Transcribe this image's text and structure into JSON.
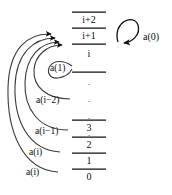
{
  "diagram": {
    "ink_color": "#111111",
    "background": "#ffffff",
    "stack": {
      "name": "index-column",
      "levels": [
        {
          "id": "lvl-i2",
          "label": "i+2",
          "x": 72,
          "y": 14,
          "line_y": 12
        },
        {
          "id": "lvl-i1",
          "label": "i+1",
          "x": 72,
          "y": 30,
          "line_y": 28
        },
        {
          "id": "lvl-i",
          "label": "i",
          "x": 72,
          "y": 47,
          "line_y": 44
        },
        {
          "id": "lvl-dots",
          "label": "",
          "x": 72,
          "y": 64,
          "line_y": 72
        },
        {
          "id": "lvl-3",
          "label": "3",
          "x": 72,
          "y": 123,
          "line_y": 120
        },
        {
          "id": "lvl-2",
          "label": "2",
          "x": 72,
          "y": 140,
          "line_y": 137
        },
        {
          "id": "lvl-1",
          "label": "1",
          "x": 72,
          "y": 156,
          "line_y": 153
        },
        {
          "id": "lvl-0",
          "label": "0",
          "x": 72,
          "y": 172,
          "line_y": 169
        }
      ],
      "ellipsis_glyph": "·"
    },
    "arrow_labels": [
      {
        "id": "arrow-label-a1",
        "text": "a(1)",
        "x": 50,
        "y": 68
      },
      {
        "id": "arrow-label-ai2",
        "text": "a(i−2)",
        "x": 37,
        "y": 100
      },
      {
        "id": "arrow-label-ai1",
        "text": "a(i−1)",
        "x": 36,
        "y": 131
      },
      {
        "id": "arrow-label-ai-a",
        "text": "a(i)",
        "x": 30,
        "y": 152
      },
      {
        "id": "arrow-label-ai-b",
        "text": "a(i)",
        "x": 27,
        "y": 172
      }
    ],
    "self_loop": {
      "id": "self-loop-a0",
      "label": "a(0)",
      "label_x": 143,
      "label_y": 37
    }
  }
}
